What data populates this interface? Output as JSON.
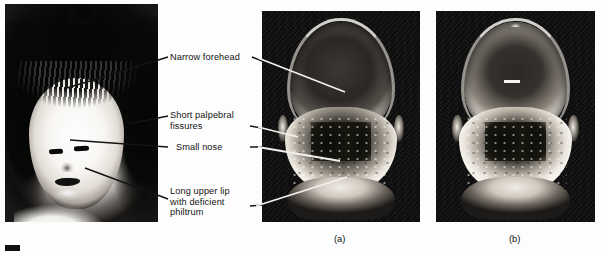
{
  "figure": {
    "kind": "clinical-photograph-figure",
    "background_color": "#ffffff",
    "ink_color": "#141414",
    "mark_color": "#111111"
  },
  "panels": [
    {
      "id": "portrait",
      "name": "child-facial-portrait",
      "caption": "",
      "description": "Black and white photograph of a child's face with dark bangs"
    },
    {
      "id": "a",
      "name": "scanning-electron-micrograph-a",
      "caption": "(a)",
      "description": "Scanning electron micrograph of an affected embryonic face"
    },
    {
      "id": "b",
      "name": "scanning-electron-micrograph-b",
      "caption": "(b)",
      "description": "Scanning electron micrograph of a normal embryonic face"
    }
  ],
  "annotations": [
    {
      "id": "narrow-forehead",
      "text": "Narrow forehead",
      "lines": [
        "Narrow forehead"
      ]
    },
    {
      "id": "short-palpebral-fissures",
      "text": "Short palpebral\nfissures",
      "lines": [
        "Short palpebral",
        "fissures"
      ]
    },
    {
      "id": "small-nose",
      "text": "Small nose",
      "lines": [
        "Small nose"
      ]
    },
    {
      "id": "long-upper-lip",
      "text": "Long upper lip\nwith deficient\nphiltrum",
      "lines": [
        "Long upper lip",
        "with deficient",
        "philtrum"
      ]
    }
  ],
  "captions": {
    "panel_a": "(a)",
    "panel_b": "(b)"
  },
  "leader_lines": {
    "color_on_photo": "#f2f0ec",
    "color_on_white": "#141414",
    "count": 8
  }
}
